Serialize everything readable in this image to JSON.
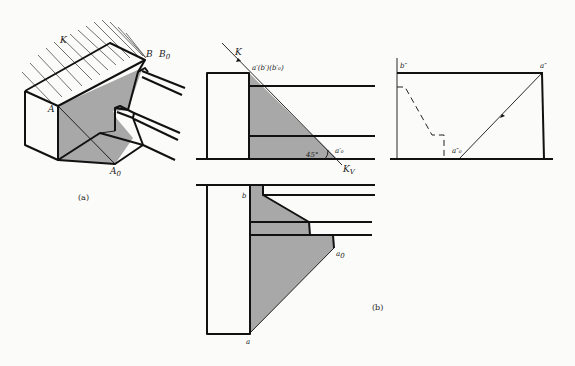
{
  "figure": {
    "colors": {
      "line": "#111111",
      "shadow": "#a8a8a8",
      "background": "#fbfbf9"
    }
  },
  "view_a": {
    "caption": "(a)",
    "labels": {
      "light": "K",
      "point_b": "B",
      "point_b0": "B",
      "point_b0_sub": "0",
      "point_a": "A",
      "point_a0": "A",
      "point_a0_sub": "0"
    }
  },
  "view_b_front": {
    "labels": {
      "light": "K",
      "points": "a′(b′)(b′₀)",
      "angle": "45°",
      "a0": "a′₀",
      "kv": "K",
      "kv_sub": "V"
    }
  },
  "view_b_side": {
    "labels": {
      "b2": "b″",
      "a2": "a″",
      "a02": "a″₀"
    }
  },
  "view_b_plan": {
    "labels": {
      "b": "b",
      "a": "a",
      "a0": "a",
      "a0_sub": "0"
    }
  },
  "view_b": {
    "caption": "(b)"
  }
}
